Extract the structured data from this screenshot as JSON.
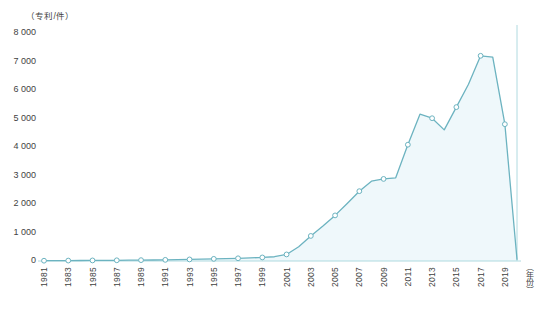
{
  "chart_data": {
    "type": "area",
    "title": "",
    "subtitle": "",
    "xlabel": "（年份）",
    "ylabel": "（专利/件）",
    "ylim": [
      0,
      8000
    ],
    "xlim": [
      1981,
      2020
    ],
    "ytick_labels": [
      "8 000",
      "7 000",
      "6 000",
      "5 000",
      "4 000",
      "3 000",
      "2 000",
      "1 000",
      "0"
    ],
    "ytick_values": [
      8000,
      7000,
      6000,
      5000,
      4000,
      3000,
      2000,
      1000,
      0
    ],
    "xtick_labels": [
      "1981",
      "1983",
      "1985",
      "1987",
      "1989",
      "1991",
      "1993",
      "1995",
      "1997",
      "1999",
      "2001",
      "2003",
      "2005",
      "2007",
      "2009",
      "2011",
      "2013",
      "2015",
      "2017",
      "2019"
    ],
    "grid": false,
    "legend": false,
    "legend_position": "none",
    "markers": "open-circle",
    "line_color": "#6cb3c0",
    "fill_color": "#eff8fb",
    "marker_color": "#ffffff",
    "axis_color": "#9dd0d8",
    "x": [
      1981,
      1982,
      1983,
      1984,
      1985,
      1986,
      1987,
      1988,
      1989,
      1990,
      1991,
      1992,
      1993,
      1994,
      1995,
      1996,
      1997,
      1998,
      1999,
      2000,
      2001,
      2002,
      2003,
      2004,
      2005,
      2006,
      2007,
      2008,
      2009,
      2010,
      2011,
      2012,
      2013,
      2014,
      2015,
      2016,
      2017,
      2018,
      2019,
      2020
    ],
    "values": [
      10,
      12,
      15,
      18,
      20,
      22,
      25,
      28,
      30,
      35,
      40,
      45,
      55,
      65,
      75,
      85,
      95,
      110,
      125,
      150,
      230,
      500,
      880,
      1230,
      1600,
      2020,
      2450,
      2800,
      2880,
      2920,
      4080,
      5150,
      5010,
      4600,
      5400,
      6200,
      7200,
      7150,
      4800,
      60
    ],
    "series": [
      {
        "name": "专利数量",
        "values": [
          10,
          12,
          15,
          18,
          20,
          22,
          25,
          28,
          30,
          35,
          40,
          45,
          55,
          65,
          75,
          85,
          95,
          110,
          125,
          150,
          230,
          500,
          880,
          1230,
          1600,
          2020,
          2450,
          2800,
          2880,
          2920,
          4080,
          5150,
          5010,
          4600,
          5400,
          6200,
          7200,
          7150,
          4800,
          60
        ]
      }
    ],
    "annotations": []
  }
}
